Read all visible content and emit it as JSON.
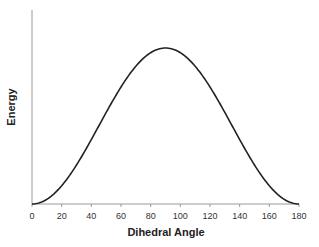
{
  "chart_data": {
    "type": "line",
    "title": "",
    "xlabel": "Dihedral Angle",
    "ylabel": "Energy",
    "xlim": [
      0,
      180
    ],
    "ylim": [
      0,
      1.15
    ],
    "x_ticks": [
      0,
      20,
      40,
      60,
      80,
      100,
      120,
      140,
      160,
      180
    ],
    "y_ticks": [],
    "grid": false,
    "legend": null,
    "series": [
      {
        "name": "Energy",
        "color": "#222222",
        "x": [
          0,
          10,
          20,
          30,
          40,
          50,
          60,
          70,
          80,
          90,
          100,
          110,
          120,
          130,
          140,
          150,
          160,
          170,
          180
        ],
        "values": [
          0.0,
          0.03,
          0.117,
          0.25,
          0.413,
          0.587,
          0.75,
          0.883,
          0.97,
          1.0,
          0.97,
          0.883,
          0.75,
          0.587,
          0.413,
          0.25,
          0.117,
          0.03,
          0.0
        ]
      }
    ]
  }
}
